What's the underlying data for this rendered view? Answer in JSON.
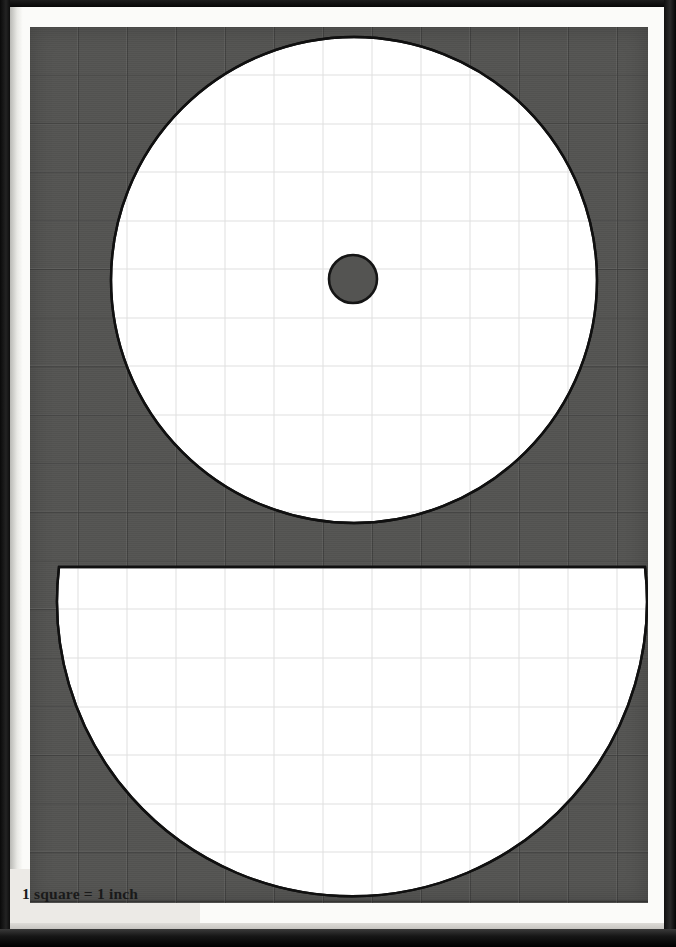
{
  "page": {
    "kind": "printed-template-page",
    "caption": "1 square = 1 inch",
    "background_color": "#fbfbf9",
    "frame_color": "#0b0b0b"
  },
  "grid": {
    "label": "one-inch measurement grid",
    "fill_color": "#545452",
    "line_color": "#141414",
    "square_size_px": 49,
    "columns": 13,
    "rows": 18,
    "unit": "inch",
    "squares_per_unit": 1
  },
  "shapes": {
    "outline_color": "#101010",
    "fill_color": "#ffffff",
    "items": [
      {
        "name": "large-circle",
        "type": "circle",
        "cx": 324,
        "cy": 253,
        "r": 243,
        "diameter_inches": 9.9
      },
      {
        "name": "center-hole",
        "type": "circle",
        "cx": 323,
        "cy": 252,
        "r": 24,
        "diameter_inches": 1.0,
        "fill": "#545452"
      },
      {
        "name": "lower-segment",
        "type": "circle-segment",
        "cx": 324,
        "cy": 541,
        "r": 295,
        "chord_y": 540,
        "diameter_inches": 12.0
      }
    ]
  }
}
